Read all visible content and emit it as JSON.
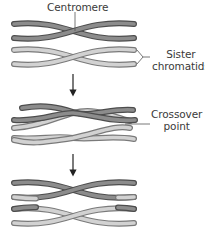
{
  "colors": {
    "dark_fill": "#8c8c8c",
    "dark_edge": "#4d4d4d",
    "light_fill": "#d2d2d2",
    "light_edge": "#7a7a7a",
    "line": "#555555",
    "text": "#3a3a3a"
  },
  "labels": {
    "centromere": "Centromere",
    "sister_line1": "Sister",
    "sister_line2": "chromatids",
    "crossover_line1": "Crossover",
    "crossover_line2": "point"
  },
  "stages": [
    {
      "name": "homologous-pair-before",
      "description": "Two pairs of sister chromatids, dark and light"
    },
    {
      "name": "crossover-stage",
      "description": "Non-sister chromatids cross at crossover point"
    },
    {
      "name": "recombinant-result",
      "description": "Chromatids with exchanged segments"
    }
  ]
}
